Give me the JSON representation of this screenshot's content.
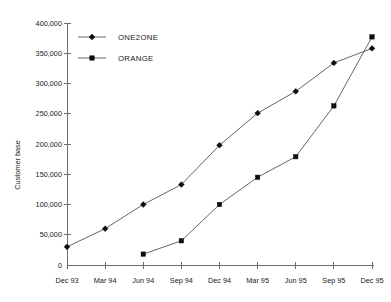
{
  "chart_data": {
    "type": "line",
    "title": "",
    "subtitle": "",
    "xlabel": "",
    "ylabel": "Customer base",
    "categories": [
      "Dec 93",
      "Mar 94",
      "Jun 94",
      "Sep 94",
      "Dec 94",
      "Mar 95",
      "Jun 95",
      "Sep 95",
      "Dec 95"
    ],
    "ylim": [
      0,
      400000
    ],
    "ytick_step": 50000,
    "ytick_labels": [
      "0",
      "50,000",
      "100,000",
      "150,000",
      "200,000",
      "250,000",
      "300,000",
      "350,000",
      "400,000"
    ],
    "ytick_values": [
      0,
      50000,
      100000,
      150000,
      200000,
      250000,
      300000,
      350000,
      400000
    ],
    "grid": false,
    "legend_position": "top-left-inside",
    "series": [
      {
        "name": "ONE2ONE",
        "marker": "diamond",
        "color": "#0d0d0d",
        "values": [
          30000,
          60000,
          100000,
          133000,
          198000,
          251000,
          287000,
          334000,
          358000
        ]
      },
      {
        "name": "ORANGE",
        "marker": "square",
        "color": "#0d0d0d",
        "values": [
          null,
          null,
          18000,
          40000,
          100000,
          145000,
          179000,
          263000,
          377000
        ]
      }
    ]
  },
  "legend": {
    "items": [
      {
        "label": "ONE2ONE",
        "marker": "diamond"
      },
      {
        "label": "ORANGE",
        "marker": "square"
      }
    ]
  },
  "axes": {
    "y_title": "Customer base"
  }
}
